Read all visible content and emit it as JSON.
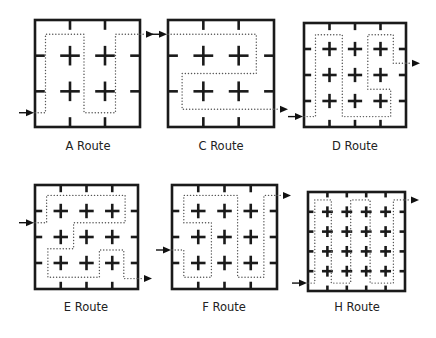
{
  "figure": {
    "panels": [
      {
        "id": "A",
        "label": "A Route",
        "grid_size": 3,
        "entry_side": "left",
        "exit_side": "right",
        "path": [
          [
            0,
            2.6
          ],
          [
            0.3,
            2.6
          ],
          [
            0.3,
            0.4
          ],
          [
            1.4,
            0.4
          ],
          [
            1.4,
            2.6
          ],
          [
            2.3,
            2.6
          ],
          [
            2.3,
            0.4
          ],
          [
            3,
            0.4
          ]
        ]
      },
      {
        "id": "C",
        "label": "C Route",
        "grid_size": 3,
        "entry_side": "left",
        "exit_side": "right",
        "path": [
          [
            0,
            0.4
          ],
          [
            2.5,
            0.4
          ],
          [
            2.5,
            1.5
          ],
          [
            0.4,
            1.5
          ],
          [
            0.4,
            2.5
          ],
          [
            3,
            2.5
          ]
        ]
      },
      {
        "id": "D",
        "label": "D Route",
        "grid_size": 4,
        "entry_side": "left",
        "exit_side": "right",
        "path": [
          [
            0,
            3.6
          ],
          [
            0.45,
            3.6
          ],
          [
            0.45,
            0.45
          ],
          [
            1.5,
            0.45
          ],
          [
            1.5,
            3.6
          ],
          [
            3.4,
            3.6
          ],
          [
            3.4,
            2.55
          ],
          [
            2.5,
            2.55
          ],
          [
            2.5,
            0.45
          ],
          [
            3.5,
            0.45
          ],
          [
            3.5,
            1.55
          ],
          [
            4,
            1.55
          ]
        ]
      },
      {
        "id": "E",
        "label": "E Route",
        "grid_size": 4,
        "entry_side": "left",
        "exit_side": "right",
        "path": [
          [
            0,
            1.45
          ],
          [
            0.45,
            1.45
          ],
          [
            0.45,
            0.4
          ],
          [
            3.5,
            0.4
          ],
          [
            3.5,
            1.45
          ],
          [
            1.5,
            1.45
          ],
          [
            1.5,
            2.45
          ],
          [
            0.5,
            2.45
          ],
          [
            0.5,
            3.55
          ],
          [
            2.5,
            3.55
          ],
          [
            2.5,
            2.5
          ],
          [
            3.45,
            2.5
          ],
          [
            3.45,
            3.6
          ],
          [
            4,
            3.6
          ]
        ]
      },
      {
        "id": "F",
        "label": "F Route",
        "grid_size": 4,
        "entry_side": "left",
        "exit_side": "right",
        "path": [
          [
            0,
            2.5
          ],
          [
            0.45,
            2.5
          ],
          [
            0.45,
            3.55
          ],
          [
            1.5,
            3.55
          ],
          [
            1.5,
            1.45
          ],
          [
            0.45,
            1.45
          ],
          [
            0.45,
            0.4
          ],
          [
            2.5,
            0.4
          ],
          [
            2.5,
            3.55
          ],
          [
            3.5,
            3.55
          ],
          [
            3.5,
            0.4
          ],
          [
            4,
            0.4
          ]
        ]
      },
      {
        "id": "H",
        "label": "H Route",
        "grid_size": 5,
        "entry_side": "left",
        "exit_side": "right",
        "path": [
          [
            0,
            4.6
          ],
          [
            0.35,
            4.6
          ],
          [
            0.35,
            0.4
          ],
          [
            1.2,
            0.4
          ],
          [
            1.2,
            4.6
          ],
          [
            2.2,
            4.6
          ],
          [
            2.2,
            0.4
          ],
          [
            3.2,
            0.4
          ],
          [
            3.2,
            4.6
          ],
          [
            4.4,
            4.6
          ],
          [
            4.4,
            0.4
          ],
          [
            5,
            0.4
          ]
        ]
      }
    ],
    "colors": {
      "grid_line": "#1a1a1a",
      "route_dots": "#555555",
      "arrow": "#111111",
      "label_text": "#222222"
    }
  }
}
